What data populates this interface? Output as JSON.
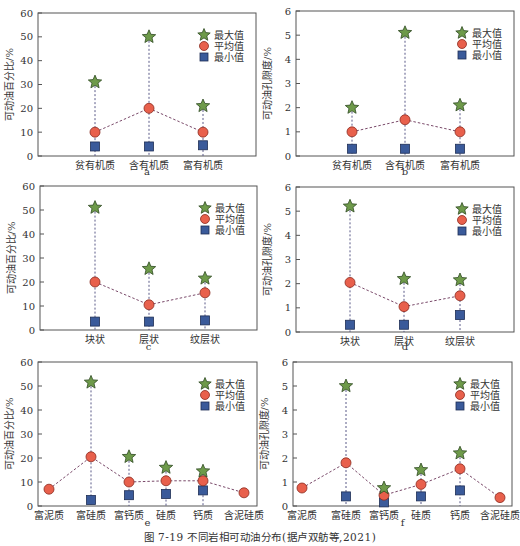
{
  "figure": {
    "caption": "图 7-19  不同岩相可动油分布(据卢双舫等,2021)"
  },
  "legend": {
    "max_label": "最大值",
    "mean_label": "平均值",
    "min_label": "最小值"
  },
  "colors": {
    "max_star": "#6e9a4a",
    "mean_circle": "#e8604c",
    "min_square": "#3a5a9a",
    "frame": "#555555",
    "dash": "#5a5a88"
  },
  "chart_data": [
    {
      "panel": "a",
      "type": "scatter",
      "title": "",
      "xlabel": "a",
      "ylabel": "可动油百分比/%",
      "ylim": [
        0,
        60
      ],
      "yticks": [
        0,
        10,
        20,
        30,
        40,
        50,
        60
      ],
      "categories": [
        "贫有机质",
        "含有机质",
        "富有机质"
      ],
      "series": [
        {
          "name": "最大值",
          "values": [
            31,
            50,
            21
          ]
        },
        {
          "name": "平均值",
          "values": [
            10,
            20,
            10
          ]
        },
        {
          "name": "最小值",
          "values": [
            4,
            4,
            4.5
          ]
        }
      ],
      "legend_position": "upper right",
      "grid": false
    },
    {
      "panel": "b",
      "type": "scatter",
      "title": "",
      "xlabel": "b",
      "ylabel": "可动油孔隙度/%",
      "ylim": [
        0,
        6
      ],
      "yticks": [
        0,
        1,
        2,
        3,
        4,
        5,
        6
      ],
      "categories": [
        "贫有机质",
        "含有机质",
        "富有机质"
      ],
      "series": [
        {
          "name": "最大值",
          "values": [
            2.0,
            5.1,
            2.1
          ]
        },
        {
          "name": "平均值",
          "values": [
            1.0,
            1.5,
            1.0
          ]
        },
        {
          "name": "最小值",
          "values": [
            0.3,
            0.3,
            0.3
          ]
        }
      ],
      "legend_position": "upper right",
      "grid": false
    },
    {
      "panel": "c",
      "type": "scatter",
      "title": "",
      "xlabel": "c",
      "ylabel": "可动油百分比/%",
      "ylim": [
        0,
        60
      ],
      "yticks": [
        0,
        10,
        20,
        30,
        40,
        50,
        60
      ],
      "categories": [
        "块状",
        "层状",
        "纹层状"
      ],
      "series": [
        {
          "name": "最大值",
          "values": [
            51,
            25.5,
            21.5
          ]
        },
        {
          "name": "平均值",
          "values": [
            20,
            10.5,
            15.5
          ]
        },
        {
          "name": "最小值",
          "values": [
            3.5,
            3.5,
            4
          ]
        }
      ],
      "legend_position": "upper right",
      "grid": false
    },
    {
      "panel": "d",
      "type": "scatter",
      "title": "",
      "xlabel": "d",
      "ylabel": "可动油孔隙度/%",
      "ylim": [
        0,
        6
      ],
      "yticks": [
        0,
        1,
        2,
        3,
        4,
        5,
        6
      ],
      "categories": [
        "块状",
        "层状",
        "纹层状"
      ],
      "series": [
        {
          "name": "最大值",
          "values": [
            5.2,
            2.2,
            2.15
          ]
        },
        {
          "name": "平均值",
          "values": [
            2.05,
            1.05,
            1.5
          ]
        },
        {
          "name": "最小值",
          "values": [
            0.3,
            0.3,
            0.7
          ]
        }
      ],
      "legend_position": "upper right",
      "grid": false
    },
    {
      "panel": "e",
      "type": "scatter",
      "title": "",
      "xlabel": "e",
      "ylabel": "可动油百分比/%",
      "ylim": [
        0,
        60
      ],
      "yticks": [
        0,
        10,
        20,
        30,
        40,
        50,
        60
      ],
      "categories": [
        "富泥质",
        "富硅质",
        "富钙质",
        "硅质",
        "钙质",
        "含泥硅质"
      ],
      "series": [
        {
          "name": "最大值",
          "values": [
            null,
            51.5,
            20.5,
            16,
            14.5,
            null
          ]
        },
        {
          "name": "平均值",
          "values": [
            7,
            20.5,
            10,
            10.5,
            10.5,
            5.5
          ]
        },
        {
          "name": "最小值",
          "values": [
            null,
            2.5,
            4.5,
            5,
            6.5,
            null
          ]
        }
      ],
      "legend_position": "upper right",
      "grid": false
    },
    {
      "panel": "f",
      "type": "scatter",
      "title": "",
      "xlabel": "f",
      "ylabel": "可动油孔隙度/%",
      "ylim": [
        0,
        6
      ],
      "yticks": [
        0,
        1,
        2,
        3,
        4,
        5,
        6
      ],
      "categories": [
        "富泥质",
        "富硅质",
        "富钙质",
        "硅质",
        "钙质",
        "含泥硅质"
      ],
      "series": [
        {
          "name": "最大值",
          "values": [
            null,
            5.0,
            0.75,
            1.5,
            2.2,
            null
          ]
        },
        {
          "name": "平均值",
          "values": [
            0.75,
            1.8,
            0.45,
            0.9,
            1.55,
            0.35
          ]
        },
        {
          "name": "最小值",
          "values": [
            null,
            0.4,
            0.15,
            0.4,
            0.65,
            null
          ]
        }
      ],
      "legend_position": "upper right",
      "grid": false
    }
  ]
}
